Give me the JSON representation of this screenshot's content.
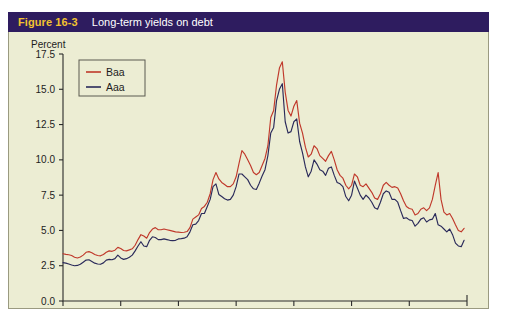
{
  "figure": {
    "number": "Figure 16-3",
    "title": "Long-term yields on debt"
  },
  "colors": {
    "header_background": "#2e1c5f",
    "figure_number": "#f2c230",
    "title_text": "#ffffff",
    "plot_background": "#ecedd3",
    "axis": "#2b2b2b",
    "baa_line": "#c0392b",
    "aaa_line": "#2a2a5a"
  },
  "chart_data": {
    "type": "line",
    "title": "Long-term yields on debt",
    "xlabel": "",
    "ylabel": "Percent",
    "ylim": [
      0.0,
      17.5
    ],
    "xlim": [
      1944,
      2014
    ],
    "ytick_labels": [
      "0.0",
      "2.5",
      "5.0",
      "7.5",
      "10.0",
      "12.5",
      "15.0",
      "17.5"
    ],
    "ytick_values": [
      0.0,
      2.5,
      5.0,
      7.5,
      10.0,
      12.5,
      15.0,
      17.5
    ],
    "xtick_labels": [
      "1944",
      "1954",
      "1964",
      "1974",
      "1984",
      "1994",
      "2004",
      "2014"
    ],
    "xtick_values": [
      1944,
      1954,
      1964,
      1974,
      1984,
      1994,
      2004,
      2014
    ],
    "grid": false,
    "legend_position": "top-left",
    "legend_entries": [
      "Baa",
      "Aaa"
    ],
    "x": [
      1944.0,
      1944.5,
      1945.0,
      1945.5,
      1946.0,
      1946.5,
      1947.0,
      1947.5,
      1948.0,
      1948.5,
      1949.0,
      1949.5,
      1950.0,
      1950.5,
      1951.0,
      1951.5,
      1952.0,
      1952.5,
      1953.0,
      1953.5,
      1954.0,
      1954.5,
      1955.0,
      1955.5,
      1956.0,
      1956.5,
      1957.0,
      1957.5,
      1958.0,
      1958.5,
      1959.0,
      1959.5,
      1960.0,
      1960.5,
      1961.0,
      1961.5,
      1962.0,
      1962.5,
      1963.0,
      1963.5,
      1964.0,
      1964.5,
      1965.0,
      1965.5,
      1966.0,
      1966.5,
      1967.0,
      1967.5,
      1968.0,
      1968.5,
      1969.0,
      1969.5,
      1970.0,
      1970.5,
      1971.0,
      1971.5,
      1972.0,
      1972.5,
      1973.0,
      1973.5,
      1974.0,
      1974.5,
      1975.0,
      1975.5,
      1976.0,
      1976.5,
      1977.0,
      1977.5,
      1978.0,
      1978.5,
      1979.0,
      1979.5,
      1980.0,
      1980.5,
      1981.0,
      1981.5,
      1982.0,
      1982.5,
      1983.0,
      1983.5,
      1984.0,
      1984.5,
      1985.0,
      1985.5,
      1986.0,
      1986.5,
      1987.0,
      1987.5,
      1988.0,
      1988.5,
      1989.0,
      1989.5,
      1990.0,
      1990.5,
      1991.0,
      1991.5,
      1992.0,
      1992.5,
      1993.0,
      1993.5,
      1994.0,
      1994.5,
      1995.0,
      1995.5,
      1996.0,
      1996.5,
      1997.0,
      1997.5,
      1998.0,
      1998.5,
      1999.0,
      1999.5,
      2000.0,
      2000.5,
      2001.0,
      2001.5,
      2002.0,
      2002.5,
      2003.0,
      2003.5,
      2004.0,
      2004.5,
      2005.0,
      2005.5,
      2006.0,
      2006.5,
      2007.0,
      2007.5,
      2008.0,
      2008.5,
      2009.0,
      2009.5,
      2010.0,
      2010.5,
      2011.0,
      2011.5,
      2012.0,
      2012.5,
      2013.0,
      2013.5
    ],
    "series": [
      {
        "name": "Baa",
        "color": "#c0392b",
        "values": [
          3.35,
          3.3,
          3.28,
          3.22,
          3.1,
          3.05,
          3.12,
          3.25,
          3.45,
          3.5,
          3.42,
          3.3,
          3.22,
          3.2,
          3.3,
          3.45,
          3.55,
          3.52,
          3.6,
          3.8,
          3.72,
          3.58,
          3.55,
          3.62,
          3.7,
          3.95,
          4.35,
          4.7,
          4.6,
          4.45,
          4.85,
          5.1,
          5.2,
          5.05,
          5.05,
          5.1,
          5.05,
          5.0,
          4.95,
          4.9,
          4.88,
          4.85,
          4.87,
          4.92,
          5.2,
          5.8,
          5.95,
          6.1,
          6.55,
          6.7,
          7.0,
          7.6,
          8.6,
          9.1,
          8.65,
          8.4,
          8.25,
          8.1,
          8.1,
          8.3,
          8.8,
          9.75,
          10.65,
          10.4,
          10.0,
          9.6,
          9.1,
          8.95,
          9.1,
          9.6,
          10.1,
          11.0,
          13.0,
          13.5,
          15.3,
          16.5,
          16.95,
          14.8,
          13.5,
          13.1,
          13.8,
          14.2,
          12.6,
          11.9,
          10.9,
          10.2,
          10.4,
          11.0,
          10.8,
          10.3,
          10.1,
          9.9,
          10.3,
          10.6,
          10.0,
          9.3,
          8.9,
          8.7,
          8.2,
          7.95,
          8.2,
          9.0,
          8.8,
          8.2,
          8.1,
          8.3,
          8.0,
          7.7,
          7.3,
          7.2,
          7.6,
          8.2,
          8.4,
          8.2,
          8.05,
          8.1,
          8.0,
          7.6,
          7.1,
          6.7,
          6.55,
          6.5,
          6.1,
          6.2,
          6.5,
          6.6,
          6.4,
          6.6,
          7.2,
          8.2,
          9.1,
          7.2,
          6.3,
          6.1,
          6.2,
          5.85,
          5.4,
          5.0,
          4.9,
          5.15
        ]
      },
      {
        "name": "Aaa",
        "color": "#2a2a5a",
        "values": [
          2.72,
          2.68,
          2.62,
          2.55,
          2.5,
          2.52,
          2.6,
          2.75,
          2.9,
          2.92,
          2.8,
          2.68,
          2.62,
          2.6,
          2.7,
          2.9,
          2.95,
          2.92,
          3.0,
          3.25,
          3.05,
          2.95,
          3.0,
          3.1,
          3.25,
          3.55,
          3.9,
          4.2,
          3.9,
          3.85,
          4.3,
          4.55,
          4.5,
          4.35,
          4.35,
          4.4,
          4.35,
          4.3,
          4.28,
          4.3,
          4.4,
          4.42,
          4.45,
          4.55,
          4.9,
          5.4,
          5.45,
          5.7,
          6.2,
          6.2,
          6.7,
          7.2,
          8.1,
          8.3,
          7.55,
          7.4,
          7.25,
          7.15,
          7.2,
          7.5,
          8.1,
          9.0,
          9.0,
          8.8,
          8.6,
          8.2,
          7.95,
          7.9,
          8.35,
          8.85,
          9.3,
          10.3,
          11.9,
          12.3,
          14.2,
          15.0,
          15.4,
          12.7,
          11.9,
          12.0,
          12.7,
          12.9,
          11.3,
          10.5,
          9.5,
          8.8,
          9.2,
          10.0,
          9.7,
          9.3,
          9.2,
          8.9,
          9.4,
          9.5,
          8.9,
          8.4,
          8.3,
          8.1,
          7.4,
          7.1,
          7.5,
          8.5,
          8.0,
          7.5,
          7.2,
          7.5,
          7.3,
          7.0,
          6.6,
          6.5,
          7.0,
          7.6,
          7.8,
          7.7,
          7.2,
          7.2,
          7.0,
          6.4,
          5.85,
          5.9,
          5.75,
          5.7,
          5.3,
          5.5,
          5.8,
          5.9,
          5.6,
          5.75,
          5.8,
          6.2,
          5.4,
          5.3,
          5.1,
          4.9,
          5.1,
          4.7,
          4.1,
          3.9,
          3.85,
          4.3
        ]
      }
    ]
  },
  "axes": {
    "y_title": "Percent"
  }
}
